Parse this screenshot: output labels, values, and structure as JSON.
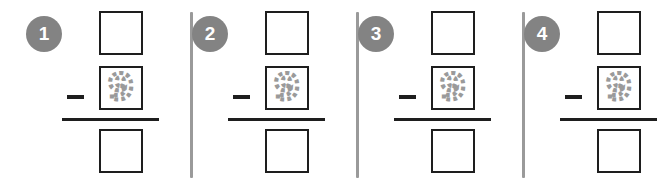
{
  "worksheet": {
    "title": "Subtraction tracing worksheet",
    "background_color": "#ffffff",
    "panel_count": 4,
    "divider_color": "#9a9a9a",
    "badge_color": "#838383",
    "badge_text_color": "#ffffff",
    "ink_color": "#1e1e1e",
    "trace_color": "#9a9a9a"
  },
  "problems": [
    {
      "number": "1",
      "operator": "−",
      "minuend": "",
      "subtrahend": "9",
      "difference": "",
      "subtrahend_style": "dashed-trace"
    },
    {
      "number": "2",
      "operator": "−",
      "minuend": "",
      "subtrahend": "9",
      "difference": "",
      "subtrahend_style": "dashed-trace"
    },
    {
      "number": "3",
      "operator": "−",
      "minuend": "",
      "subtrahend": "9",
      "difference": "",
      "subtrahend_style": "dashed-trace"
    },
    {
      "number": "4",
      "operator": "−",
      "minuend": "",
      "subtrahend": "9",
      "difference": "",
      "subtrahend_style": "dashed-trace"
    }
  ]
}
